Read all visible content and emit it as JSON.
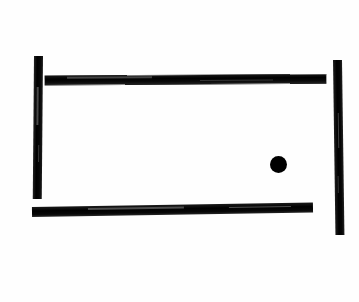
{
  "scene": {
    "title": "Pong",
    "description": "Hand-drawn pong game field",
    "background_color": "#fefefe",
    "stroke_color": "#000000",
    "width": 359,
    "height": 302
  },
  "field": {
    "label": "play-field"
  },
  "objects": {
    "wall_top": {
      "label": "Top wall",
      "x": 45,
      "y": 76,
      "width": 281,
      "height": 9,
      "rotation_deg": -0.35,
      "color": "#000000"
    },
    "wall_bottom": {
      "label": "Bottom wall",
      "x": 32,
      "y": 207,
      "width": 281,
      "height": 10,
      "rotation_deg": -0.9,
      "color": "#000000"
    },
    "paddle_left": {
      "label": "Left paddle",
      "x": 34,
      "y": 56,
      "width": 9,
      "height": 143,
      "rotation_deg": 0.5,
      "color": "#000000"
    },
    "paddle_right": {
      "label": "Right paddle",
      "x": 333,
      "y": 60,
      "width": 9,
      "height": 175,
      "rotation_deg": -0.8,
      "color": "#000000"
    },
    "ball": {
      "label": "Ball",
      "x": 270,
      "y": 156,
      "diameter": 17,
      "center_x": 278,
      "center_y": 164,
      "color": "#000000"
    }
  }
}
